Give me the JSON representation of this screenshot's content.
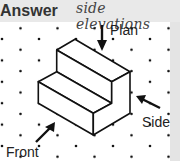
{
  "header": {
    "title": "Answer",
    "note": "side elevations"
  },
  "diagram": {
    "type": "isometric-drawing",
    "labels": {
      "plan": "Plan",
      "side": "Side",
      "front": "Front"
    },
    "arrows": [
      {
        "name": "plan-arrow",
        "direction": "down"
      },
      {
        "name": "side-arrow",
        "direction": "up-left"
      },
      {
        "name": "front-arrow",
        "direction": "up-right"
      }
    ],
    "colors": {
      "background": "#ffffff",
      "header": "#e9e9e9",
      "ink": "#111111"
    }
  }
}
